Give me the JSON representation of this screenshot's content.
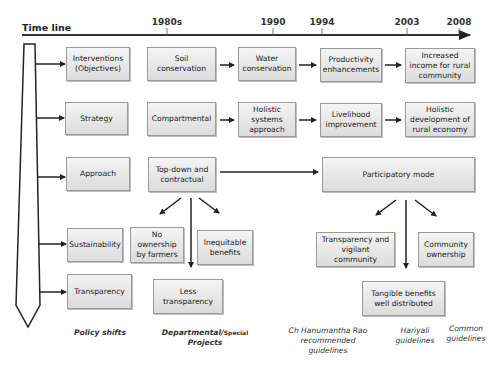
{
  "timeline": {
    "label": "Time line",
    "years": [
      {
        "label": "1980s",
        "x": 167
      },
      {
        "label": "1990",
        "x": 273
      },
      {
        "label": "1994",
        "x": 322
      },
      {
        "label": "2003",
        "x": 407
      },
      {
        "label": "2008",
        "x": 459
      }
    ]
  },
  "rows": {
    "interventions": {
      "label": "Interventions (Objectives)",
      "steps": [
        "Soil conservation",
        "Water conservation",
        "Productivity enhancements",
        "Increased income for rural community"
      ]
    },
    "strategy": {
      "label": "Strategy",
      "steps": [
        "Compartmental",
        "Holistic systems approach",
        "Livelihood improvement",
        "Holistic development of rural economy"
      ]
    },
    "approach": {
      "label": "Approach",
      "old": "Top-down and contractual",
      "new": "Participatory mode"
    },
    "sustainability": {
      "label": "Sustainability"
    },
    "transparency": {
      "label": "Transparency"
    }
  },
  "old_outcomes": {
    "no_ownership": "No ownership by farmers",
    "inequitable": "Inequitable benefits",
    "less_transparency": "Less transparency"
  },
  "new_outcomes": {
    "vigilant": "Transparency and vigilant community",
    "community_ownership": "Community ownership",
    "tangible": "Tangible benefits well distributed"
  },
  "captions": {
    "policy_shifts": "Policy shifts",
    "departmental_main": "Departmental/",
    "departmental_special": "Special",
    "departmental_projects": "Projects",
    "hanumantha": "Ch Hanumantha Rao recommended guidelines",
    "hariyali": "Hariyali guidelines",
    "common": "Common guidelines"
  },
  "colors": {
    "box_border": "#9a9a9a",
    "box_top": "#f4f4f4",
    "box_bottom": "#dcdcdc",
    "line": "#222222"
  }
}
